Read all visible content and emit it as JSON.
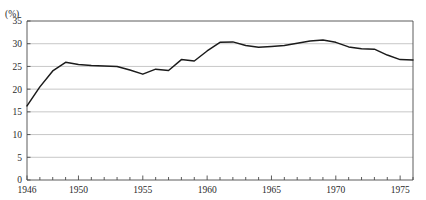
{
  "figure": {
    "top_caption": "",
    "unit_label": "(%)"
  },
  "chart_data": {
    "type": "line",
    "title": "",
    "subtitle": "",
    "xlabel": "",
    "ylabel": "(%)",
    "unit": "%",
    "grid": true,
    "grid_axis": "y",
    "legend": null,
    "legend_position": "none",
    "xlim": [
      1946,
      1976
    ],
    "ylim": [
      0,
      35
    ],
    "ytick_labels": [
      "0",
      "5",
      "10",
      "15",
      "20",
      "25",
      "30",
      "35"
    ],
    "yticks": [
      0,
      5,
      10,
      15,
      20,
      25,
      30,
      35
    ],
    "xtick_labels": [
      "1946",
      "1950",
      "1955",
      "1960",
      "1965",
      "1970",
      "1975"
    ],
    "xticks_labeled": [
      1946,
      1950,
      1955,
      1960,
      1965,
      1970,
      1975
    ],
    "xticks_minor_every": 1,
    "series": [
      {
        "name": "",
        "color": "#1b1b1b",
        "x": [
          1946,
          1947,
          1948,
          1949,
          1950,
          1951,
          1952,
          1953,
          1954,
          1955,
          1956,
          1957,
          1958,
          1959,
          1960,
          1961,
          1962,
          1963,
          1964,
          1965,
          1966,
          1967,
          1968,
          1969,
          1970,
          1971,
          1972,
          1973,
          1974,
          1975,
          1976
        ],
        "values": [
          16.3,
          20.5,
          24.0,
          25.9,
          25.4,
          25.2,
          25.1,
          25.0,
          24.2,
          23.3,
          24.4,
          24.1,
          26.5,
          26.2,
          28.4,
          30.3,
          30.4,
          29.6,
          29.2,
          29.4,
          29.6,
          30.1,
          30.6,
          30.8,
          30.3,
          29.3,
          28.9,
          28.8,
          27.5,
          26.5,
          26.4
        ]
      }
    ]
  },
  "colors": {
    "line": "#1b1b1b",
    "frame": "#4a4a4a",
    "grid": "#b9b9b9",
    "text": "#2a2a2a",
    "background": "#ffffff"
  }
}
